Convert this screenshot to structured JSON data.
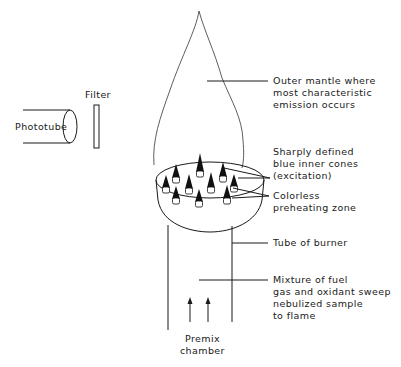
{
  "diagram": {
    "type": "flame-anatomy-schematic",
    "labels": {
      "phototube": "Phototube",
      "filter": "Filter",
      "outer_mantle": [
        "Outer mantle where",
        "most characteristic",
        "emission occurs"
      ],
      "inner_cones": [
        "Sharply defined",
        "blue inner cones",
        "(excitation)"
      ],
      "preheating_zone": [
        "Colorless",
        "preheating zone"
      ],
      "tube": [
        "Tube of burner"
      ],
      "mixture": [
        "Mixture of fuel",
        "gas and oxidant sweep",
        "nebulized sample",
        "to flame"
      ],
      "premix": [
        "Premix",
        "chamber"
      ]
    },
    "colors": {
      "line": "#1a1a1a",
      "background": "#ffffff",
      "cone_fill": "#111111"
    },
    "cone_count": 10,
    "flow_arrow_count": 2
  }
}
